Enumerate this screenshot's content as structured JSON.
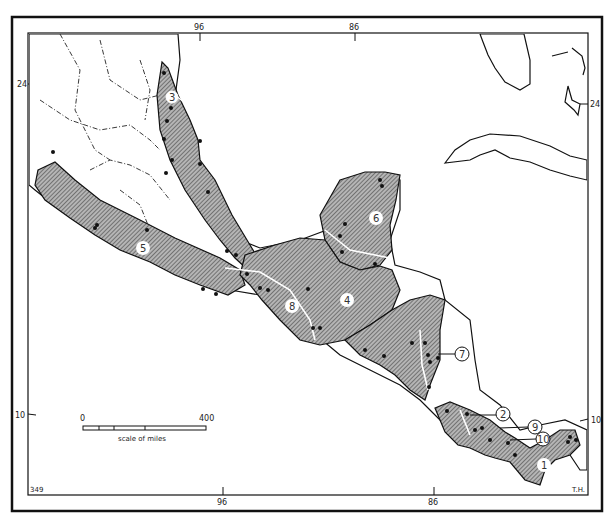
{
  "map": {
    "type": "distribution map",
    "region": "Mexico and Central America",
    "longitude_ticks": {
      "top": [
        "96",
        "86"
      ],
      "bottom": [
        "96",
        "86"
      ]
    },
    "latitude_ticks": {
      "left": [
        "24",
        "10"
      ],
      "right": [
        "24",
        "10"
      ]
    },
    "scale_bar": {
      "start": "0",
      "end": "400",
      "caption": "scale of miles"
    },
    "zones": [
      {
        "id": "1",
        "label": "1"
      },
      {
        "id": "2",
        "label": "2"
      },
      {
        "id": "3",
        "label": "3"
      },
      {
        "id": "4",
        "label": "4"
      },
      {
        "id": "5",
        "label": "5"
      },
      {
        "id": "6",
        "label": "6"
      },
      {
        "id": "7",
        "label": "7"
      },
      {
        "id": "8",
        "label": "8"
      },
      {
        "id": "9",
        "label": "9"
      },
      {
        "id": "10",
        "label": "10"
      }
    ],
    "corner_marks": {
      "bottom_left": "349",
      "bottom_right": "T.H."
    },
    "colors": {
      "hatch_fill": "#9a9a9a",
      "line": "#111111",
      "paper": "#ffffff"
    }
  }
}
